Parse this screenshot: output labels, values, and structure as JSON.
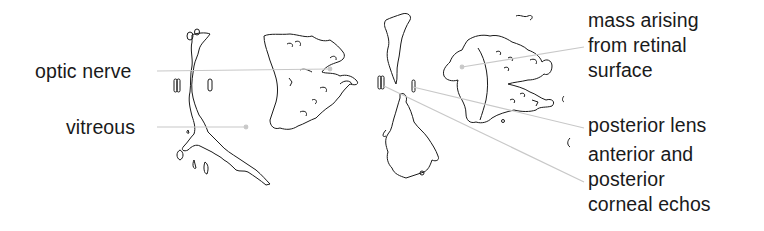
{
  "diagram": {
    "type": "ultrasound eye illustration with labels",
    "labels_left": [
      {
        "id": "optic-nerve",
        "text": "optic nerve"
      },
      {
        "id": "vitreous",
        "text": "vitreous"
      }
    ],
    "labels_right": [
      {
        "id": "mass",
        "lines": [
          "mass arising",
          "from retinal",
          "surface"
        ]
      },
      {
        "id": "posterior-lens",
        "lines": [
          "posterior lens"
        ]
      },
      {
        "id": "corneal-echos",
        "lines": [
          "anterior and",
          "posterior",
          "corneal echos"
        ]
      }
    ],
    "colors": {
      "ink": "#1a1a1a",
      "leader": "#c8c8c8",
      "background": "#ffffff"
    }
  }
}
